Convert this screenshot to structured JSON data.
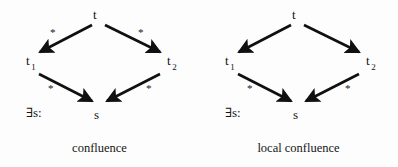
{
  "figure": {
    "background_color": "#fdfdfd",
    "ink_color": "#101010",
    "panels": [
      {
        "id": "confluence",
        "caption": "confluence",
        "nodes": {
          "top": {
            "label": "t",
            "subscript": ""
          },
          "left": {
            "label": "t",
            "subscript": "1"
          },
          "right": {
            "label": "t",
            "subscript": "2"
          },
          "bottom": {
            "label": "s",
            "subscript": ""
          }
        },
        "quantifier_label": "∃s:",
        "edges": [
          {
            "from": "top",
            "to": "left",
            "label": "*",
            "position": "upper-left"
          },
          {
            "from": "top",
            "to": "right",
            "label": "*",
            "position": "upper-right"
          },
          {
            "from": "left",
            "to": "bottom",
            "label": "*",
            "position": "lower-left"
          },
          {
            "from": "right",
            "to": "bottom",
            "label": "*",
            "position": "lower-right"
          }
        ]
      },
      {
        "id": "local-confluence",
        "caption": "local confluence",
        "nodes": {
          "top": {
            "label": "t",
            "subscript": ""
          },
          "left": {
            "label": "t",
            "subscript": "1"
          },
          "right": {
            "label": "t",
            "subscript": "2"
          },
          "bottom": {
            "label": "s",
            "subscript": ""
          }
        },
        "quantifier_label": "∃s:",
        "edges": [
          {
            "from": "top",
            "to": "left",
            "label": "",
            "position": "upper-left"
          },
          {
            "from": "top",
            "to": "right",
            "label": "",
            "position": "upper-right"
          },
          {
            "from": "left",
            "to": "bottom",
            "label": "*",
            "position": "lower-left"
          },
          {
            "from": "right",
            "to": "bottom",
            "label": "*",
            "position": "lower-right"
          }
        ]
      }
    ]
  }
}
